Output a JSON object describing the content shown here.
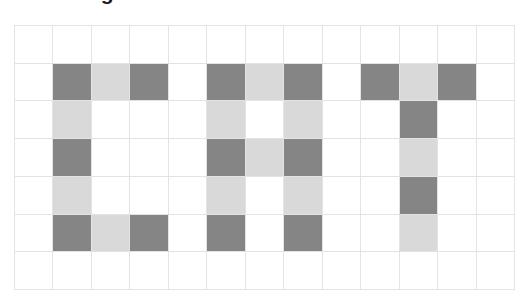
{
  "title": {
    "text": "Pixel Image",
    "note": "clipped-at-top-edge"
  },
  "colors": {
    "dark_cell": "#858585",
    "light_cell": "#d9d9d9",
    "empty_cell": "#ffffff",
    "grid_line": "#e3e3e3",
    "page_background": "#ffffff"
  },
  "chart_data": {
    "type": "heatmap",
    "title": "Pixel Image",
    "xlabel": "",
    "ylabel": "",
    "rows": 7,
    "cols": 13,
    "word": "CAT",
    "legend": [
      {
        "label": "dark",
        "value": 2,
        "color": "#858585"
      },
      {
        "label": "light",
        "value": 1,
        "color": "#d9d9d9"
      },
      {
        "label": "empty",
        "value": 0,
        "color": "#ffffff"
      }
    ],
    "letters": [
      {
        "char": "C",
        "col_start": 1,
        "col_end": 3,
        "row_start": 1,
        "row_end": 5
      },
      {
        "char": "A",
        "col_start": 5,
        "col_end": 7,
        "row_start": 1,
        "row_end": 5
      },
      {
        "char": "T",
        "col_start": 9,
        "col_end": 11,
        "row_start": 1,
        "row_end": 5
      }
    ],
    "values": [
      [
        0,
        0,
        0,
        0,
        0,
        0,
        0,
        0,
        0,
        0,
        0,
        0,
        0
      ],
      [
        0,
        2,
        1,
        2,
        0,
        2,
        1,
        2,
        0,
        2,
        1,
        2,
        0
      ],
      [
        0,
        1,
        0,
        0,
        0,
        1,
        0,
        1,
        0,
        0,
        2,
        0,
        0
      ],
      [
        0,
        2,
        0,
        0,
        0,
        2,
        1,
        2,
        0,
        0,
        1,
        0,
        0
      ],
      [
        0,
        1,
        0,
        0,
        0,
        1,
        0,
        1,
        0,
        0,
        2,
        0,
        0
      ],
      [
        0,
        2,
        1,
        2,
        0,
        2,
        0,
        2,
        0,
        0,
        1,
        0,
        0
      ],
      [
        0,
        0,
        0,
        0,
        0,
        0,
        0,
        0,
        0,
        0,
        0,
        0,
        0
      ]
    ]
  }
}
